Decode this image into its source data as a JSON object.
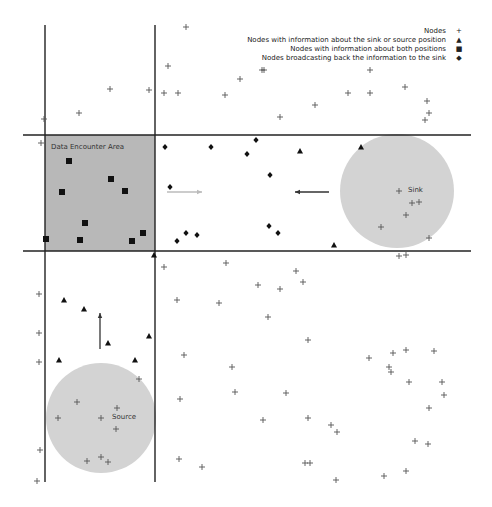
{
  "legend": {
    "items": [
      {
        "label": "Nodes",
        "symbol": "plus"
      },
      {
        "label": "Nodes with information about the sink or source position",
        "symbol": "triangle"
      },
      {
        "label": "Nodes with information about both positions",
        "symbol": "square"
      },
      {
        "label": "Nodes broadcasting back the information to the sink",
        "symbol": "diamond"
      }
    ]
  },
  "labels": {
    "data_encounter_area": "Data Encounter Area",
    "sink": "Sink",
    "source": "Source"
  },
  "colors": {
    "area_fill": "#b8b8b8",
    "circle_fill": "#d3d3d3",
    "line": "#222222",
    "marker": "#111111",
    "plus": "#555555",
    "arrow_light": "#bbbbbb",
    "arrow_dark": "#333333"
  },
  "geometry": {
    "vlines": [
      {
        "x": 45,
        "y1": 25,
        "y2": 482
      },
      {
        "x": 155,
        "y1": 25,
        "y2": 482
      }
    ],
    "hlines": [
      {
        "y": 135,
        "x1": 23,
        "x2": 471
      },
      {
        "y": 251,
        "x1": 23,
        "x2": 471
      }
    ],
    "area_rect": {
      "x": 45,
      "y": 135,
      "w": 110,
      "h": 116
    },
    "sink_circle": {
      "cx": 397,
      "cy": 191,
      "r": 57
    },
    "source_circle": {
      "cx": 101,
      "cy": 418,
      "r": 55
    }
  },
  "arrows": [
    {
      "name": "arrow-right-light",
      "x1": 167,
      "y1": 192,
      "x2": 202,
      "y2": 192,
      "color": "#bbbbbb"
    },
    {
      "name": "arrow-left-dark",
      "x1": 329,
      "y1": 192,
      "x2": 295,
      "y2": 192,
      "color": "#333333"
    },
    {
      "name": "arrow-up-dark",
      "x1": 100,
      "y1": 349,
      "x2": 100,
      "y2": 313,
      "color": "#333333"
    }
  ],
  "nodes": {
    "plus": [
      [
        186,
        27
      ],
      [
        168,
        66
      ],
      [
        240,
        79
      ],
      [
        110,
        89
      ],
      [
        149,
        90
      ],
      [
        164,
        93
      ],
      [
        178,
        93
      ],
      [
        225,
        95
      ],
      [
        44,
        119
      ],
      [
        79,
        113
      ],
      [
        262,
        70
      ],
      [
        264,
        70
      ],
      [
        370,
        70
      ],
      [
        405,
        87
      ],
      [
        348,
        93
      ],
      [
        370,
        93
      ],
      [
        315,
        105
      ],
      [
        427,
        101
      ],
      [
        429,
        113
      ],
      [
        280,
        117
      ],
      [
        425,
        120
      ],
      [
        41,
        143
      ],
      [
        399,
        191
      ],
      [
        412,
        203
      ],
      [
        419,
        202
      ],
      [
        406,
        215
      ],
      [
        381,
        227
      ],
      [
        429,
        238
      ],
      [
        399,
        256
      ],
      [
        406,
        255
      ],
      [
        296,
        271
      ],
      [
        303,
        282
      ],
      [
        258,
        285
      ],
      [
        280,
        289
      ],
      [
        164,
        267
      ],
      [
        226,
        263
      ],
      [
        177,
        300
      ],
      [
        219,
        303
      ],
      [
        268,
        317
      ],
      [
        308,
        340
      ],
      [
        369,
        358
      ],
      [
        393,
        353
      ],
      [
        406,
        350
      ],
      [
        434,
        351
      ],
      [
        39,
        294
      ],
      [
        39,
        333
      ],
      [
        39,
        362
      ],
      [
        184,
        355
      ],
      [
        232,
        367
      ],
      [
        389,
        367
      ],
      [
        391,
        372
      ],
      [
        409,
        382
      ],
      [
        442,
        382
      ],
      [
        180,
        399
      ],
      [
        235,
        392
      ],
      [
        286,
        393
      ],
      [
        139,
        379
      ],
      [
        77,
        402
      ],
      [
        58,
        418
      ],
      [
        101,
        418
      ],
      [
        117,
        408
      ],
      [
        116,
        429
      ],
      [
        87,
        461
      ],
      [
        101,
        457
      ],
      [
        108,
        462
      ],
      [
        429,
        408
      ],
      [
        444,
        395
      ],
      [
        263,
        420
      ],
      [
        308,
        418
      ],
      [
        331,
        425
      ],
      [
        337,
        432
      ],
      [
        415,
        441
      ],
      [
        428,
        444
      ],
      [
        40,
        450
      ],
      [
        37,
        481
      ],
      [
        179,
        459
      ],
      [
        202,
        467
      ],
      [
        305,
        463
      ],
      [
        310,
        463
      ],
      [
        336,
        480
      ],
      [
        384,
        476
      ],
      [
        406,
        471
      ]
    ],
    "triangle": [
      [
        154,
        255
      ],
      [
        300,
        151
      ],
      [
        64,
        300
      ],
      [
        84,
        309
      ],
      [
        149,
        336
      ],
      [
        108,
        343
      ],
      [
        59,
        360
      ],
      [
        135,
        360
      ],
      [
        334,
        245
      ],
      [
        361,
        147
      ]
    ],
    "square": [
      [
        69,
        161
      ],
      [
        111,
        179
      ],
      [
        62,
        192
      ],
      [
        125,
        191
      ],
      [
        85,
        223
      ],
      [
        46,
        239
      ],
      [
        80,
        240
      ],
      [
        132,
        241
      ],
      [
        143,
        233
      ]
    ],
    "diamond": [
      [
        165,
        147
      ],
      [
        211,
        147
      ],
      [
        247,
        154
      ],
      [
        256,
        140
      ],
      [
        270,
        175
      ],
      [
        170,
        187
      ],
      [
        177,
        241
      ],
      [
        186,
        233
      ],
      [
        197,
        235
      ],
      [
        269,
        226
      ],
      [
        278,
        233
      ]
    ]
  }
}
